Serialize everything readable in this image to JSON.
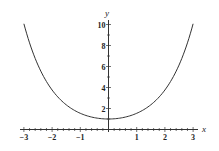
{
  "chart_data": {
    "type": "line",
    "title": "",
    "xlabel": "x",
    "ylabel": "y",
    "xlim": [
      -3,
      3
    ],
    "ylim": [
      0,
      10
    ],
    "grid": false,
    "legend": null,
    "function": "cosh(x)",
    "x_ticks": [
      -3,
      -2,
      -1,
      1,
      2,
      3
    ],
    "x_tick_labels": [
      "−3",
      "−2",
      "−1",
      "1",
      "2",
      "3"
    ],
    "y_ticks": [
      2,
      4,
      6,
      8,
      10
    ],
    "y_tick_labels": [
      "2",
      "4",
      "6",
      "8",
      "10"
    ],
    "series": [
      {
        "name": "y = cosh(x)",
        "x": [
          -3,
          -2.5,
          -2,
          -1.5,
          -1,
          -0.5,
          0,
          0.5,
          1,
          1.5,
          2,
          2.5,
          3
        ],
        "y": [
          10.07,
          6.13,
          3.76,
          2.35,
          1.54,
          1.13,
          1.0,
          1.13,
          1.54,
          2.35,
          3.76,
          6.13,
          10.07
        ]
      }
    ],
    "colors": {
      "curve": "#333333",
      "axes": "#333333"
    }
  }
}
